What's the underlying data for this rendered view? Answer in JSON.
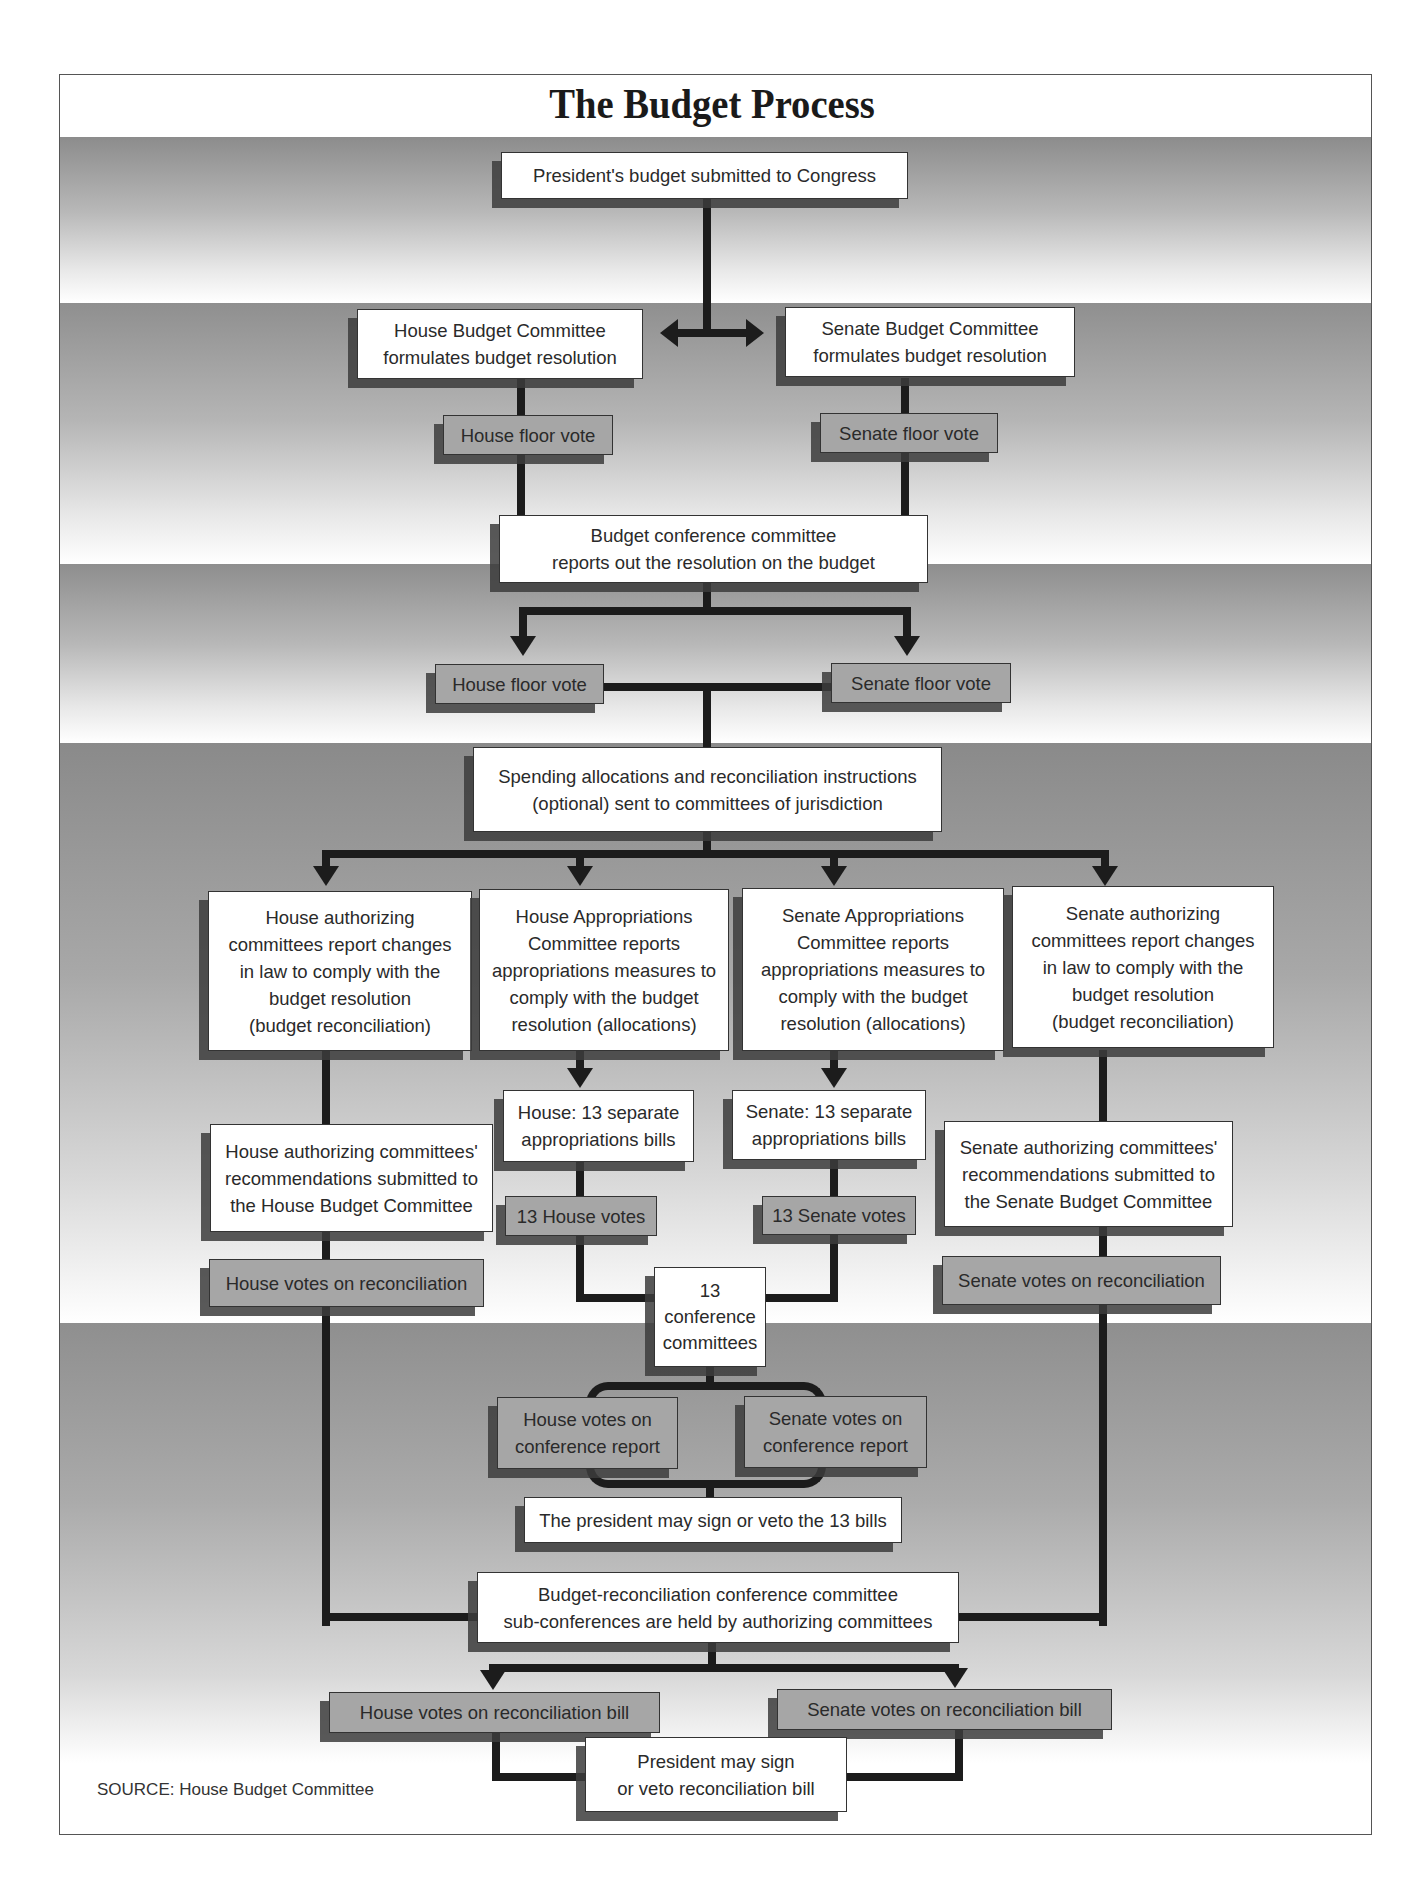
{
  "title": "The Budget Process",
  "source": "SOURCE: House Budget Committee",
  "colors": {
    "box_white": "#ffffff",
    "box_gray": "#a6a6a6",
    "connector": "#1c1c1c",
    "band_dark": "#8f8f8f"
  },
  "steps": {
    "president_submits": "President's budget submitted to Congress",
    "house_budget_committee": "House Budget Committee\nformulates budget resolution",
    "senate_budget_committee": "Senate Budget Committee\nformulates budget resolution",
    "house_floor_vote_1": "House floor vote",
    "senate_floor_vote_1": "Senate  floor vote",
    "budget_conference": "Budget conference committee\nreports out the resolution on the budget",
    "house_floor_vote_2": "House floor vote",
    "senate_floor_vote_2": "Senate  floor vote",
    "spending_allocations": "Spending allocations and reconciliation instructions\n(optional) sent to committees of jurisdiction",
    "house_authorizing": "House authorizing\ncommittees report changes\nin law to comply with the\nbudget resolution\n(budget reconciliation)",
    "house_appropriations": "House Appropriations\nCommittee reports\nappropriations measures to\ncomply with the budget\nresolution (allocations)",
    "senate_appropriations": "Senate Appropriations\nCommittee reports\nappropriations measures to\ncomply with the budget\nresolution (allocations)",
    "senate_authorizing": "Senate authorizing\ncommittees report changes\nin law to comply with the\nbudget resolution\n(budget reconciliation)",
    "house_13_bills": "House: 13 separate\nappropriations bills",
    "senate_13_bills": "Senate: 13 separate\nappropriations bills",
    "house_auth_recommendations": "House authorizing committees'\nrecommendations submitted to\nthe House Budget Committee",
    "senate_auth_recommendations": "Senate authorizing committees'\nrecommendations submitted to\nthe Senate Budget Committee",
    "house_13_votes": "13 House votes",
    "senate_13_votes": "13 Senate votes",
    "house_votes_reconciliation": "House votes on reconciliation",
    "senate_votes_reconciliation": "Senate votes on reconciliation",
    "conference_committees_13": "13\nconference\ncommittees",
    "house_votes_conference_report": "House  votes on\nconference  report",
    "senate_votes_conference_report": "Senate votes on\nconference  report",
    "president_13_bills": "The president may sign or veto the 13 bills",
    "reconciliation_conference": "Budget-reconciliation conference committee\nsub-conferences are held by authorizing committees",
    "house_votes_reconciliation_bill": "House votes on reconciliation bill",
    "senate_votes_reconciliation_bill": "Senate votes on reconciliation bill",
    "president_reconciliation_bill": "President may sign\nor veto reconciliation bill"
  }
}
